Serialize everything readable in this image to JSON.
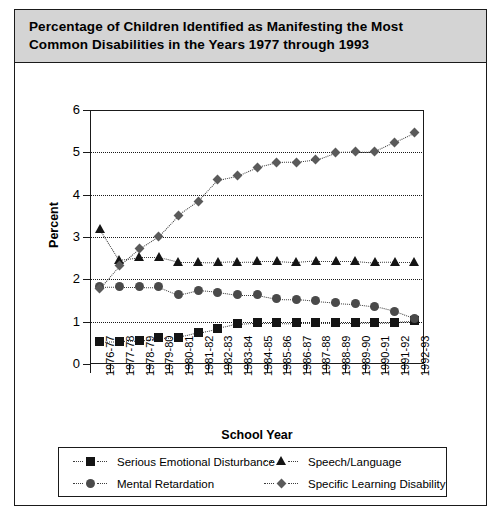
{
  "title": {
    "line1": "Percentage of Children Identified as Manifesting the Most",
    "line2": "Common Disabilities in the Years 1977 through 1993"
  },
  "chart_data": {
    "type": "line",
    "title": "Percentage of Children Identified as Manifesting the Most Common Disabilities in the Years 1977 through 1993",
    "xlabel": "School Year",
    "ylabel": "Percent",
    "ylim": [
      0,
      6
    ],
    "yticks": [
      0,
      1,
      2,
      3,
      4,
      5,
      6
    ],
    "grid": true,
    "legend_position": "bottom",
    "categories": [
      "1976-77",
      "1977-78",
      "1978-79",
      "1979-80",
      "1980-81",
      "1981-82",
      "1982-83",
      "1983-84",
      "1984-85",
      "1985-86",
      "1986-87",
      "1987-88",
      "1988-89",
      "1989-90",
      "1990-91",
      "1991-92",
      "1992-93"
    ],
    "series": [
      {
        "name": "Serious Emotional Disturbance",
        "marker": "square",
        "color": "#141414",
        "values": [
          0.52,
          0.54,
          0.55,
          0.62,
          0.63,
          0.74,
          0.84,
          0.95,
          0.98,
          0.98,
          0.97,
          0.97,
          0.97,
          0.97,
          0.98,
          0.99,
          1.02
        ]
      },
      {
        "name": "Mental Retardation",
        "marker": "circle",
        "color": "#4a4a4a",
        "values": [
          1.82,
          1.83,
          1.83,
          1.82,
          1.63,
          1.74,
          1.7,
          1.63,
          1.63,
          1.54,
          1.53,
          1.49,
          1.45,
          1.42,
          1.36,
          1.25,
          1.08
        ]
      },
      {
        "name": "Speech/Language",
        "marker": "triangle",
        "color": "#141414",
        "values": [
          3.2,
          2.46,
          2.52,
          2.52,
          2.41,
          2.41,
          2.4,
          2.42,
          2.43,
          2.43,
          2.4,
          2.44,
          2.44,
          2.44,
          2.4,
          2.41,
          2.41
        ]
      },
      {
        "name": "Specific Learning Disability",
        "marker": "diamond",
        "color": "#5a5a5a",
        "values": [
          1.79,
          2.32,
          2.72,
          3.02,
          3.51,
          3.84,
          4.35,
          4.45,
          4.65,
          4.76,
          4.77,
          4.83,
          5.0,
          5.01,
          5.02,
          5.24,
          5.46
        ]
      }
    ]
  },
  "legend": {
    "items": [
      {
        "label": "Serious Emotional Disturbance",
        "marker": "square"
      },
      {
        "label": "Speech/Language",
        "marker": "triangle"
      },
      {
        "label": "Mental Retardation",
        "marker": "circle"
      },
      {
        "label": "Specific Learning Disability",
        "marker": "diamond"
      }
    ]
  },
  "colors": {
    "banner_bg": "#d4d4d4",
    "ink": "#1a1a1a"
  }
}
